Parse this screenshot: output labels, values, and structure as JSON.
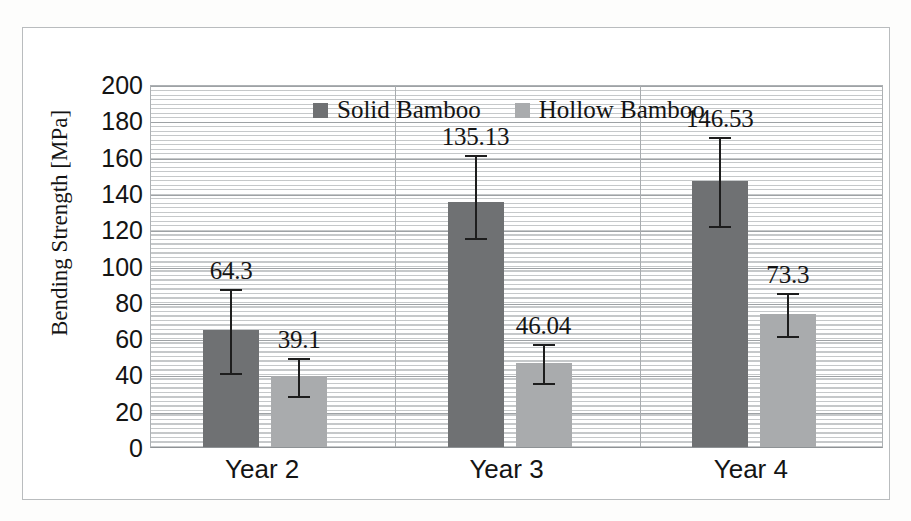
{
  "chart_data": {
    "type": "bar",
    "title": "",
    "xlabel": "",
    "ylabel": "Bending Strength [MPa]",
    "categories": [
      "Year 2",
      "Year 3",
      "Year 4"
    ],
    "ylim": [
      0,
      200
    ],
    "ytick_step": 20,
    "yticks": [
      "200",
      "180",
      "160",
      "140",
      "120",
      "100",
      "80",
      "60",
      "40",
      "20",
      "0"
    ],
    "grid": true,
    "legend_position": "top-center",
    "series": [
      {
        "name": "Solid Bamboo",
        "color": "#6f7173",
        "values": [
          64.3,
          135.13,
          146.53
        ],
        "labels": [
          "64.3",
          "135.13",
          "146.53"
        ],
        "error_low": [
          41.0,
          115.0,
          122.0
        ],
        "error_high": [
          88.0,
          162.0,
          172.0
        ]
      },
      {
        "name": "Hollow Bamboo",
        "color": "#a9abad",
        "values": [
          39.1,
          46.04,
          73.3
        ],
        "labels": [
          "39.1",
          "46.04",
          "73.3"
        ],
        "error_low": [
          28.0,
          35.0,
          61.0
        ],
        "error_high": [
          50.0,
          58.0,
          86.0
        ]
      }
    ]
  },
  "legend": {
    "items": [
      {
        "label": "Solid Bamboo",
        "swatch": "solid"
      },
      {
        "label": "Hollow Bamboo",
        "swatch": "hollow"
      }
    ]
  }
}
